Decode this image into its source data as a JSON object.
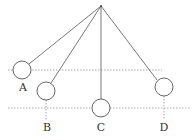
{
  "diagram": {
    "title": "",
    "pivot": {
      "x": 101,
      "y": 6
    },
    "reference_lines": [
      {
        "name": "upper-level",
        "y": 70,
        "x1": 8,
        "x2": 162
      },
      {
        "name": "lower-level",
        "y": 108,
        "x1": 8,
        "x2": 190
      }
    ],
    "balls": [
      {
        "label": "A",
        "cx": 22,
        "cy": 70,
        "r": 9,
        "label_x": 23,
        "label_y": 91,
        "drop_line": null
      },
      {
        "label": "B",
        "cx": 46,
        "cy": 91,
        "r": 9,
        "label_x": 47,
        "label_y": 131,
        "drop_line": {
          "y1": 100,
          "y2": 120
        }
      },
      {
        "label": "C",
        "cx": 101,
        "cy": 108,
        "r": 9,
        "label_x": 101,
        "label_y": 131,
        "drop_line": null
      },
      {
        "label": "D",
        "cx": 164,
        "cy": 87,
        "r": 9,
        "label_x": 164,
        "label_y": 131,
        "drop_line": {
          "y1": 96,
          "y2": 120
        }
      }
    ]
  }
}
